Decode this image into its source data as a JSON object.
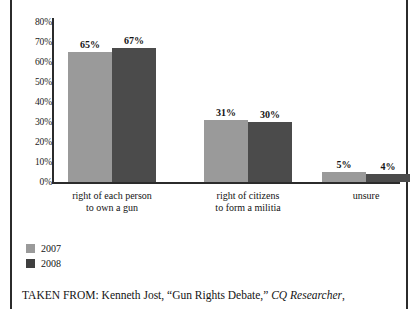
{
  "chart_data": {
    "type": "bar",
    "title": "",
    "xlabel": "",
    "ylabel": "",
    "ylim": [
      0,
      80
    ],
    "grid": false,
    "legend_position": "bottom-left",
    "categories": [
      "right of each person\nto own a gun",
      "right of citizens\nto form a militia",
      "unsure"
    ],
    "category_lines": [
      [
        "right of each person",
        "to own a gun"
      ],
      [
        "right of citizens",
        "to form a militia"
      ],
      [
        "unsure"
      ]
    ],
    "series": [
      {
        "name": "2007",
        "color": "#9a9a9a",
        "values": [
          65,
          31,
          5
        ],
        "labels": [
          "65%",
          "31%",
          "5%"
        ]
      },
      {
        "name": "2008",
        "color": "#4b4b4b",
        "values": [
          67,
          30,
          4
        ],
        "labels": [
          "67%",
          "30%",
          "4%"
        ]
      }
    ],
    "yticks": [
      80,
      70,
      60,
      50,
      40,
      30,
      20,
      10,
      0
    ],
    "ytick_labels": [
      "80%",
      "70%",
      "60%",
      "50%",
      "40%",
      "30%",
      "20%",
      "10%",
      "0%"
    ]
  },
  "legend": {
    "items": [
      {
        "label": "2007",
        "color": "#9a9a9a"
      },
      {
        "label": "2008",
        "color": "#3f3f3f"
      }
    ]
  },
  "caption": {
    "prefix": "TAKEN FROM: Kenneth Jost, “Gun Rights Debate,” ",
    "source_italic": "CQ Researcher",
    "suffix": ","
  }
}
